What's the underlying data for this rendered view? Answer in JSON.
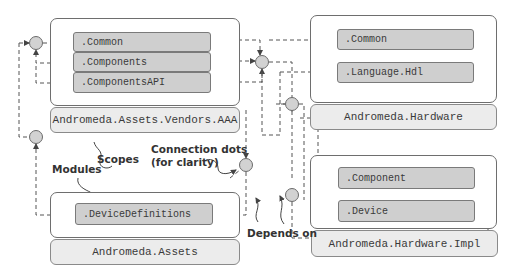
{
  "diagram": {
    "modules": [
      {
        "name": "Andromeda.Assets.Vendors.AAA",
        "scopes": [
          ".Common",
          ".Components",
          ".ComponentsAPI"
        ]
      },
      {
        "name": "Andromeda.Assets",
        "scopes": [
          ".DeviceDefinitions"
        ]
      },
      {
        "name": "Andromeda.Hardware",
        "scopes": [
          ".Common",
          ".Language.Hdl"
        ]
      },
      {
        "name": "Andromeda.Hardware.Impl",
        "scopes": [
          ".Component",
          ".Device"
        ]
      }
    ],
    "annotations": {
      "scopes": "Scopes",
      "modules": "Modules",
      "connection_dots_line1": "Connection dots",
      "connection_dots_line2": "(for clarity)",
      "depends_on": "Depends on"
    },
    "colors": {
      "scope_fill": "#cfcfcf",
      "module_label_fill": "#ececec",
      "dot_fill": "#d2d2d2",
      "line": "#555555"
    }
  }
}
